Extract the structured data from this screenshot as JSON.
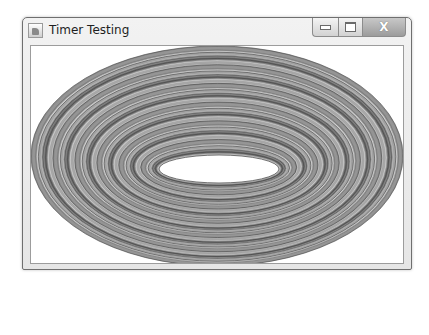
{
  "window": {
    "title": "Timer Testing",
    "icon": "java-cup-icon",
    "controls": {
      "minimize": "minimize-icon",
      "maximize": "maximize-icon",
      "close_glyph": "X"
    }
  },
  "canvas": {
    "description": "Concentric ellipses drawn in grayscale tones",
    "outer_ellipse": {
      "cx": 186,
      "cy": 110,
      "rx": 186,
      "ry": 110
    },
    "inner_hole": {
      "cx": 188,
      "cy": 123,
      "rx": 60,
      "ry": 14
    },
    "ring_colors": [
      "#8a8a8a",
      "#b5b5b5",
      "#6c6c6c",
      "#c8c8c8",
      "#7d7d7d",
      "#a4a4a4",
      "#5e5e5e",
      "#bdbdbd",
      "#949494",
      "#d0d0d0",
      "#727272",
      "#aaaaaa"
    ],
    "hole_color": "#ffffff"
  }
}
